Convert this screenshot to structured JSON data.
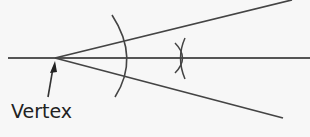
{
  "diagram": {
    "type": "angle-bisector-construction",
    "label": "Vertex",
    "colors": {
      "line": "#444444",
      "background": "#f7f7f7",
      "text": "#222222"
    },
    "elements": [
      {
        "name": "horizontal-bisector-line",
        "from": [
          8,
          58
        ],
        "to": [
          310,
          58
        ]
      },
      {
        "name": "upper-ray",
        "from": [
          55,
          58
        ],
        "to": [
          292,
          0
        ]
      },
      {
        "name": "lower-ray",
        "from": [
          55,
          58
        ],
        "to": [
          283,
          118
        ]
      },
      {
        "name": "compass-arc",
        "points": [
          [
            113,
            15
          ],
          [
            127,
            58
          ],
          [
            115,
            97
          ]
        ]
      },
      {
        "name": "intersection-arcs",
        "center": [
          182,
          58
        ]
      },
      {
        "name": "vertex-arrow",
        "tip": [
          55,
          61
        ],
        "tail": [
          48,
          97
        ]
      }
    ]
  }
}
